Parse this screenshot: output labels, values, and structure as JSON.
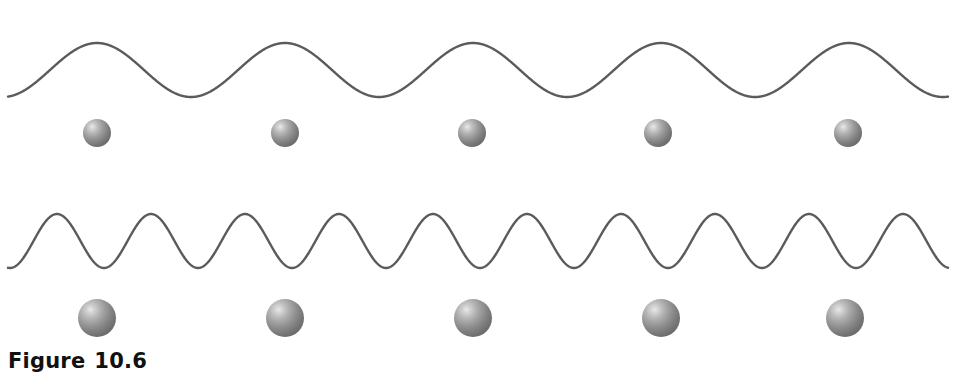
{
  "figure": {
    "caption_label": "Figure",
    "caption_number": "10.6",
    "caption_font_size_px": 21,
    "background_color": "#ffffff",
    "width": 956,
    "height": 376
  },
  "style": {
    "wave_stroke_color": "#5b5b5b",
    "wave_stroke_width": 2.4,
    "sphere_base_color": "#8a8a8a",
    "sphere_highlight_color": "#e9e9e9",
    "sphere_shadow_color": "#646464",
    "caption_color": "#111111"
  },
  "rows": [
    {
      "id": "row-long-wavelength",
      "name": "low-frequency-row",
      "wave": {
        "name": "long-wavelength-wave",
        "cycles": 5,
        "wavelength_px": 188,
        "amplitude_px": 27,
        "baseline_y": 70,
        "crest_y": 43,
        "trough_y": 97,
        "x_start": 8,
        "x_end": 948,
        "phase_offset_px": 97
      },
      "particles": {
        "name": "small-particles",
        "count": 5,
        "radius_px": 14,
        "center_y": 133,
        "centers_x": [
          97,
          285,
          472,
          658,
          848
        ]
      }
    },
    {
      "id": "row-short-wavelength",
      "name": "high-frequency-row",
      "wave": {
        "name": "short-wavelength-wave",
        "cycles": 10,
        "wavelength_px": 94,
        "amplitude_px": 27,
        "baseline_y": 241,
        "crest_y": 214,
        "trough_y": 268,
        "x_start": 8,
        "x_end": 948,
        "phase_offset_px": 57
      },
      "particles": {
        "name": "large-particles",
        "count": 5,
        "radius_px": 19,
        "center_y": 318,
        "centers_x": [
          97,
          285,
          473,
          661,
          845
        ]
      }
    }
  ]
}
